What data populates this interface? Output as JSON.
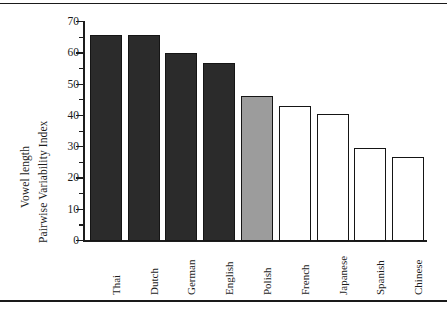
{
  "figure": {
    "background": "#ffffff",
    "frame_color": "#1c1c1c"
  },
  "axes": {
    "ylabel_line1": "Vowel length",
    "ylabel_line2": "Pairwise Variability Index",
    "xlabel": "",
    "y_ticks": [
      "0",
      "10",
      "20",
      "30",
      "40",
      "50",
      "60",
      "70"
    ],
    "y_minor_step": "5"
  },
  "colors": {
    "bar_dark": "#2b2b2b",
    "bar_gray": "#9c9c9c",
    "bar_white": "#ffffff",
    "bar_edge": "#151515"
  },
  "chart_data": {
    "type": "bar",
    "title": "",
    "subtitle": "",
    "xlabel": "",
    "ylabel": "Vowel length Pairwise Variability Index",
    "ylim": [
      0,
      70
    ],
    "grid": false,
    "legend": "none",
    "categories": [
      "Thai",
      "Dutch",
      "German",
      "English",
      "Polish",
      "French",
      "Japanese",
      "Spanish",
      "Chinese"
    ],
    "values": [
      66.0,
      65.8,
      60.0,
      57.0,
      46.3,
      43.0,
      40.5,
      29.7,
      27.0
    ],
    "bar_fills": [
      "#2b2b2b",
      "#2b2b2b",
      "#2b2b2b",
      "#2b2b2b",
      "#9c9c9c",
      "#ffffff",
      "#ffffff",
      "#ffffff",
      "#ffffff"
    ],
    "ytick_values": [
      0,
      10,
      20,
      30,
      40,
      50,
      60,
      70
    ],
    "annotations": []
  }
}
